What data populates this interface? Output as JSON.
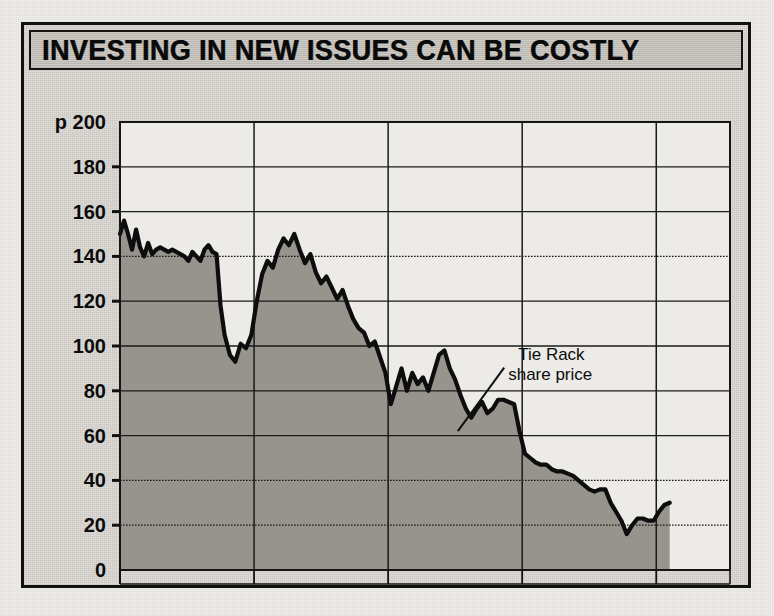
{
  "figure": {
    "title": "INVESTING IN NEW ISSUES CAN BE COSTLY"
  },
  "chart_data": {
    "type": "area",
    "title": "INVESTING IN NEW ISSUES CAN BE COSTLY",
    "subtitle": "",
    "xlabel": "",
    "ylabel": "p",
    "unit_prefix": "p",
    "ylim": [
      0,
      200
    ],
    "yticks": [
      0,
      20,
      40,
      60,
      80,
      100,
      120,
      140,
      160,
      180,
      200
    ],
    "ytick_labels": [
      "0",
      "20",
      "40",
      "60",
      "80",
      "100",
      "120",
      "140",
      "160",
      "180",
      "p 200"
    ],
    "xlim": [
      1987.0,
      1991.55
    ],
    "xtick_labels": [
      "1987",
      "1988",
      "1989",
      "1990",
      "1991"
    ],
    "xtick_positions": [
      1987.5,
      1988.5,
      1989.5,
      1990.5,
      1991.5
    ],
    "gridlines": [
      1988.0,
      1989.0,
      1990.0,
      1991.0
    ],
    "grid": true,
    "legend": "none",
    "annotations": [
      {
        "text_line_1": "Tie Rack",
        "text_line_2": "share price",
        "x": 1989.97,
        "y": 93,
        "points_to_x": 1989.52,
        "points_to_y": 62
      }
    ],
    "series": [
      {
        "name": "Tie Rack share price",
        "fill": "#8f8c87",
        "line_color": "#0d0d0d",
        "x": [
          1987.0,
          1987.03,
          1987.06,
          1987.09,
          1987.12,
          1987.15,
          1987.18,
          1987.21,
          1987.24,
          1987.27,
          1987.3,
          1987.33,
          1987.36,
          1987.39,
          1987.42,
          1987.45,
          1987.48,
          1987.51,
          1987.54,
          1987.57,
          1987.6,
          1987.63,
          1987.66,
          1987.69,
          1987.72,
          1987.75,
          1987.78,
          1987.82,
          1987.86,
          1987.9,
          1987.94,
          1987.98,
          1988.02,
          1988.06,
          1988.1,
          1988.14,
          1988.18,
          1988.22,
          1988.26,
          1988.3,
          1988.34,
          1988.38,
          1988.42,
          1988.46,
          1988.5,
          1988.54,
          1988.58,
          1988.62,
          1988.66,
          1988.7,
          1988.74,
          1988.78,
          1988.82,
          1988.86,
          1988.9,
          1988.94,
          1988.98,
          1989.02,
          1989.06,
          1989.1,
          1989.14,
          1989.18,
          1989.22,
          1989.26,
          1989.3,
          1989.34,
          1989.38,
          1989.42,
          1989.46,
          1989.5,
          1989.54,
          1989.58,
          1989.62,
          1989.66,
          1989.7,
          1989.74,
          1989.78,
          1989.82,
          1989.86,
          1989.9,
          1989.94,
          1989.98,
          1990.02,
          1990.06,
          1990.1,
          1990.14,
          1990.18,
          1990.22,
          1990.26,
          1990.3,
          1990.34,
          1990.38,
          1990.42,
          1990.46,
          1990.5,
          1990.54,
          1990.58,
          1990.62,
          1990.66,
          1990.7,
          1990.74,
          1990.78,
          1990.82,
          1990.86,
          1990.9,
          1990.94,
          1990.98,
          1991.02,
          1991.06,
          1991.1
        ],
        "y": [
          150,
          156,
          150,
          143,
          152,
          144,
          140,
          146,
          141,
          143,
          144,
          143,
          142,
          143,
          142,
          141,
          140,
          138,
          142,
          140,
          138,
          143,
          145,
          142,
          141,
          118,
          105,
          96,
          93,
          101,
          99,
          105,
          120,
          132,
          138,
          135,
          143,
          148,
          145,
          150,
          143,
          137,
          141,
          133,
          128,
          131,
          126,
          121,
          125,
          118,
          112,
          108,
          106,
          100,
          102,
          95,
          88,
          74,
          82,
          90,
          80,
          88,
          83,
          86,
          80,
          88,
          96,
          98,
          90,
          85,
          78,
          72,
          68,
          72,
          75,
          70,
          72,
          76,
          76,
          75,
          74,
          62,
          52,
          50,
          48,
          47,
          47,
          45,
          44,
          44,
          43,
          42,
          40,
          38,
          36,
          35,
          36,
          36,
          30,
          26,
          22,
          16,
          20,
          23,
          23,
          22,
          22,
          26,
          29,
          30
        ]
      }
    ]
  }
}
